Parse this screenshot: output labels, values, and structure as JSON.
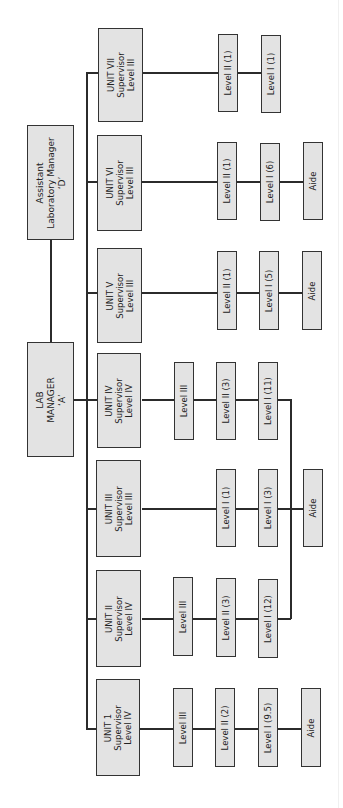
{
  "chart": {
    "orientation": "rotated-90-clockwise",
    "colors": {
      "box_fill": "#e3e3e3",
      "box_border": "#333333",
      "line": "#2b2b2b",
      "background": "#ffffff"
    },
    "managers": {
      "assistant": {
        "lines": [
          "Assistant",
          "Laboratory Manager",
          "‘D’"
        ]
      },
      "lab_manager": {
        "lines": [
          "LAB",
          "MANAGER",
          "‘A’"
        ]
      }
    },
    "units": [
      {
        "id": "unit-vii",
        "lines": [
          "UNIT VII",
          "Supervisor",
          "Level III"
        ],
        "staff": [
          "Level II (1)",
          "Level I (1)"
        ]
      },
      {
        "id": "unit-vi",
        "lines": [
          "UNIT VI",
          "Supervisor",
          "Level III"
        ],
        "staff": [
          "Level II (1)",
          "Level I (6)",
          "Aide"
        ]
      },
      {
        "id": "unit-v",
        "lines": [
          "UNIT V",
          "Supervisor",
          "Level III"
        ],
        "staff": [
          "Level II (1)",
          "Level I (5)",
          "Aide"
        ]
      },
      {
        "id": "unit-iv",
        "lines": [
          "UNIT IV",
          "Supervisor",
          "Level IV"
        ],
        "staff": [
          "Level III",
          "Level II (3)",
          "Level I (11)"
        ]
      },
      {
        "id": "unit-iii",
        "lines": [
          "UNIT III",
          "Supervisor",
          "Level III"
        ],
        "staff": [
          "Level I (1)",
          "Level I (3)",
          "Aide"
        ]
      },
      {
        "id": "unit-ii",
        "lines": [
          "UNIT II",
          "Supervisor",
          "Level IV"
        ],
        "staff": [
          "Level III",
          "Level II (3)",
          "Level I (12)"
        ]
      },
      {
        "id": "unit-1",
        "lines": [
          "UNIT 1",
          "Supervisor",
          "Level IV"
        ],
        "staff": [
          "Level III",
          "Level II (2)",
          "Level I (9.5)",
          "Aide"
        ]
      }
    ],
    "shared_aide_note": "Units II, III and IV share one Aide"
  }
}
